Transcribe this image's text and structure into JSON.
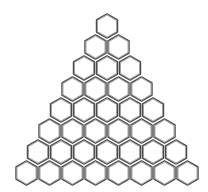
{
  "diagram": {
    "title": "",
    "shape": "triangular-hexagon-grid",
    "rows": 8,
    "hexagons_per_row": [
      1,
      2,
      3,
      4,
      5,
      6,
      7,
      8
    ],
    "total_hexagons": 36,
    "orientation": "pointy-top",
    "colors": {
      "background": "#ffffff",
      "stroke": "#4a4a4a",
      "fill": "#ffffff"
    }
  }
}
